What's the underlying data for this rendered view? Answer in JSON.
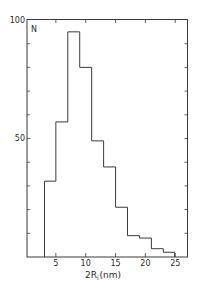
{
  "chart_data": {
    "type": "bar",
    "subtype": "histogram",
    "title": "",
    "xlabel": "2R_i (nm)",
    "xlabel_parts": {
      "main": "2R",
      "sub": "i",
      "unit": "(nm)"
    },
    "ylabel": "N",
    "xlim": [
      0,
      27
    ],
    "ylim": [
      0,
      100
    ],
    "x_ticks": [
      5,
      10,
      15,
      20,
      25
    ],
    "y_ticks_labeled": [
      50,
      100
    ],
    "y_minor_tick_step": 10,
    "grid": false,
    "legend": null,
    "bins": [
      {
        "x0": 3.1,
        "x1": 5,
        "count": 32
      },
      {
        "x0": 5,
        "x1": 7,
        "count": 57
      },
      {
        "x0": 7,
        "x1": 9,
        "count": 95
      },
      {
        "x0": 9,
        "x1": 11,
        "count": 80
      },
      {
        "x0": 11,
        "x1": 13,
        "count": 49
      },
      {
        "x0": 13,
        "x1": 15,
        "count": 38
      },
      {
        "x0": 15,
        "x1": 17,
        "count": 21
      },
      {
        "x0": 17,
        "x1": 19,
        "count": 9
      },
      {
        "x0": 19,
        "x1": 21,
        "count": 8
      },
      {
        "x0": 21,
        "x1": 23,
        "count": 3.5
      },
      {
        "x0": 23,
        "x1": 24.9,
        "count": 2
      }
    ],
    "categories": [
      "3-5",
      "5-7",
      "7-9",
      "9-11",
      "11-13",
      "13-15",
      "15-17",
      "17-19",
      "19-21",
      "21-23",
      "23-25"
    ],
    "values": [
      32,
      57,
      95,
      80,
      49,
      38,
      21,
      9,
      8,
      3.5,
      2
    ]
  },
  "labels": {
    "y_top": "100",
    "y_mid": "50",
    "n": "N",
    "x_main": "2R",
    "x_sub": "i",
    "x_unit": "(nm)"
  },
  "colors": {
    "line": "#3a3a3a",
    "background": "#ffffff"
  }
}
